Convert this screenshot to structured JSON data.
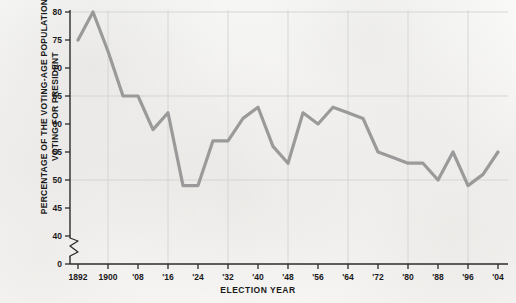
{
  "chart_data": {
    "type": "line",
    "title": "",
    "xlabel": "ELECTION YEAR",
    "ylabel": "PERCENTAGE OF THE VOTING-AGE POPULATION VOTING FOR PRESIDENT",
    "ylabel_lines": [
      "PERCENTAGE OF THE VOTING-AGE POPULATION",
      "VOTING FOR PRESIDENT"
    ],
    "categories": [
      "1892",
      "1896",
      "1900",
      "1904",
      "1908",
      "1912",
      "1916",
      "1920",
      "1924",
      "1928",
      "1932",
      "1936",
      "1940",
      "1944",
      "1948",
      "1952",
      "1956",
      "1960",
      "1964",
      "1968",
      "1972",
      "1976",
      "1980",
      "1984",
      "1988",
      "1992",
      "1996",
      "2000",
      "2004"
    ],
    "values": [
      75,
      80,
      73,
      65,
      65,
      59,
      62,
      49,
      49,
      57,
      57,
      61,
      63,
      56,
      53,
      62,
      60,
      63,
      62,
      61,
      55,
      54,
      53,
      53,
      50,
      55,
      49,
      51,
      55
    ],
    "xtick_labels": [
      "1892",
      "1900",
      "'08",
      "'16",
      "'24",
      "'32",
      "'40",
      "'48",
      "'56",
      "'64",
      "'72",
      "'80",
      "'88",
      "'96",
      "'04"
    ],
    "xtick_years": [
      1892,
      1900,
      1908,
      1916,
      1924,
      1932,
      1940,
      1948,
      1956,
      1964,
      1972,
      1980,
      1988,
      1996,
      2004
    ],
    "ytick_labels": [
      "0",
      "40",
      "45",
      "50",
      "55",
      "60",
      "65",
      "70",
      "75",
      "80"
    ],
    "ytick_values": [
      0,
      40,
      45,
      50,
      55,
      60,
      65,
      70,
      75,
      80
    ],
    "gridline_values_y": [
      50,
      65,
      80
    ],
    "gridline_years_x": [
      1900,
      1916,
      1932,
      1948,
      1964,
      1980,
      1996
    ],
    "ylim": [
      40,
      80
    ],
    "xlim": [
      1892,
      2004
    ],
    "axis_break": true,
    "axis_break_label": "0",
    "grid": true,
    "legend": "none",
    "line_color": "#9a9a9a",
    "axis_color": "#2b2b2b",
    "grid_color": "#d2d2d2",
    "background_color": "#f7f6f4"
  }
}
